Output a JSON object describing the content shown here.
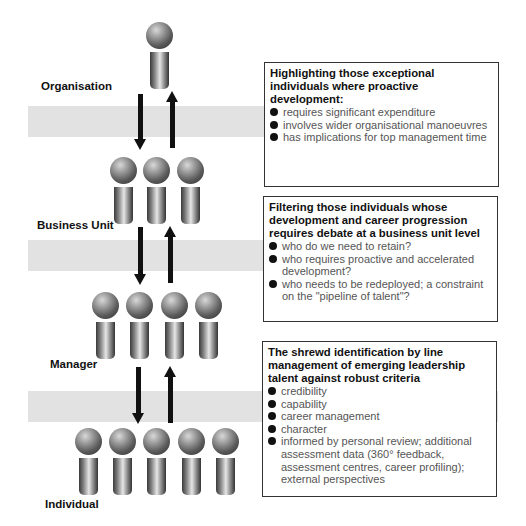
{
  "levels": [
    {
      "label": "Organisation",
      "figure_count": 1
    },
    {
      "label": "Business Unit",
      "figure_count": 3
    },
    {
      "label": "Manager",
      "figure_count": 4
    },
    {
      "label": "Individual",
      "figure_count": 5
    }
  ],
  "boxes": [
    {
      "title": "Highlighting those exceptional individuals where proactive development:",
      "bullets": [
        "requires significant expenditure",
        "involves wider organisational manoeuvres",
        "has implications for top management time"
      ]
    },
    {
      "title": "Filtering those individuals whose development and career progression requires debate at a business unit level",
      "bullets": [
        "who do we need to retain?",
        "who requires proactive and accelerated development?",
        "who needs to be redeployed; a constraint on the \"pipeline of talent\"?"
      ]
    },
    {
      "title": "The shrewd identification by line management of emerging leadership talent against robust criteria",
      "bullets": [
        "credibility",
        "capability",
        "career management",
        "character",
        "informed by personal review; additional assessment data (360° feedback, assessment centres, career profiling); external perspectives"
      ]
    }
  ],
  "icons": {
    "figure": "person-figure-icon",
    "arrow_down": "arrow-down-icon",
    "arrow_up": "arrow-up-icon",
    "bullet": "bullet-dot-icon"
  },
  "colors": {
    "band": "#e2e2e2",
    "box_border": "#333333",
    "title_text": "#111111",
    "bullet_text": "#555555"
  }
}
